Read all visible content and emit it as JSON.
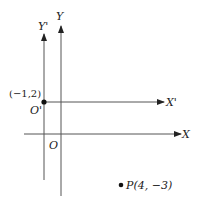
{
  "diagram": {
    "type": "coordinate-axes-translation",
    "original_axes": {
      "x_label": "X",
      "y_label": "Y",
      "origin_label": "O"
    },
    "translated_axes": {
      "x_label": "X'",
      "y_label": "Y'",
      "origin_label": "O'",
      "origin_coords_label": "(−1,2)"
    },
    "point": {
      "label": "P(4, −3)",
      "name": "P",
      "x": 4,
      "y": -3
    },
    "colors": {
      "axis": "#555555",
      "text": "#222222",
      "point": "#111111"
    }
  }
}
